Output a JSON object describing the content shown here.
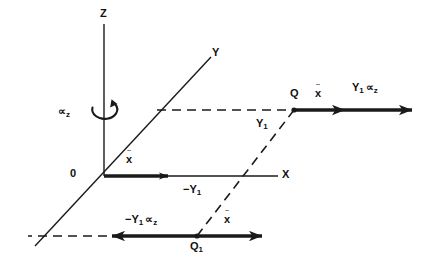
{
  "figure": {
    "background_color": "#ffffff",
    "line_color": "#1a1a1a",
    "axes": [
      {
        "id": "z",
        "label": "Z",
        "orientation": "vertical-up"
      },
      {
        "id": "y",
        "label": "Y",
        "orientation": "diagonal-up-right"
      },
      {
        "id": "x",
        "label": "X",
        "orientation": "horizontal-right"
      }
    ],
    "rotation": {
      "name": "rotation-rate-about-z",
      "label_symbol": "∝",
      "label_subscript": "z"
    },
    "points": [
      {
        "id": "origin",
        "label": "0"
      },
      {
        "id": "q",
        "label": "Q"
      },
      {
        "id": "q1",
        "label": "Q",
        "subscript": "1"
      }
    ],
    "segments": [
      {
        "id": "y1-positive",
        "label": "Y",
        "subscript": "1",
        "style": "dashed"
      },
      {
        "id": "y1-negative",
        "label": "−Y",
        "subscript": "1",
        "style": "dashed"
      }
    ],
    "vectors": [
      {
        "id": "xddot-origin",
        "label_base": "x",
        "label_accent": "¨",
        "direction": "right",
        "weight": "bold"
      },
      {
        "id": "xddot-q",
        "label_base": "x",
        "label_accent": "¨",
        "direction": "right",
        "weight": "bold"
      },
      {
        "id": "xddot-q1",
        "label_base": "x",
        "label_accent": "¨",
        "direction": "right",
        "weight": "bold"
      },
      {
        "id": "y1-alpha-z-positive",
        "label_main": "Y",
        "label_subscript": "1",
        "label_symbol": "∝",
        "label_symbol_subscript": "z",
        "direction": "right",
        "weight": "bold"
      },
      {
        "id": "y1-alpha-z-negative",
        "label_sign": "−",
        "label_main": "Y",
        "label_subscript": "1",
        "label_symbol": "∝",
        "label_symbol_subscript": "z",
        "direction": "left",
        "weight": "bold"
      }
    ]
  }
}
